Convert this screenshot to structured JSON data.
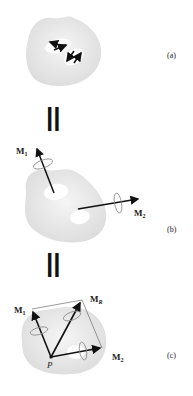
{
  "panels": [
    {
      "id": "a",
      "label": "(a)",
      "description": "Rigid body acted on by two couples (pairs of opposing arrows)"
    },
    {
      "id": "b",
      "label": "(b)",
      "description": "Couples represented as couple moment vectors M1 and M2"
    },
    {
      "id": "c",
      "label": "(c)",
      "description": "Moment vectors moved to point P and added to give resultant MR"
    }
  ],
  "equals_sign": "||",
  "vectors": {
    "m1": {
      "main": "M",
      "sub": "1"
    },
    "m2": {
      "main": "M",
      "sub": "2"
    },
    "mr": {
      "main": "M",
      "sub": "R"
    }
  },
  "point_label": "P",
  "colors": {
    "body_fill": "#e6e6e6",
    "body_highlight": "#f7f7f7",
    "arrow": "#111111",
    "ellipse": "#888888",
    "parallelogram": "#555555"
  }
}
